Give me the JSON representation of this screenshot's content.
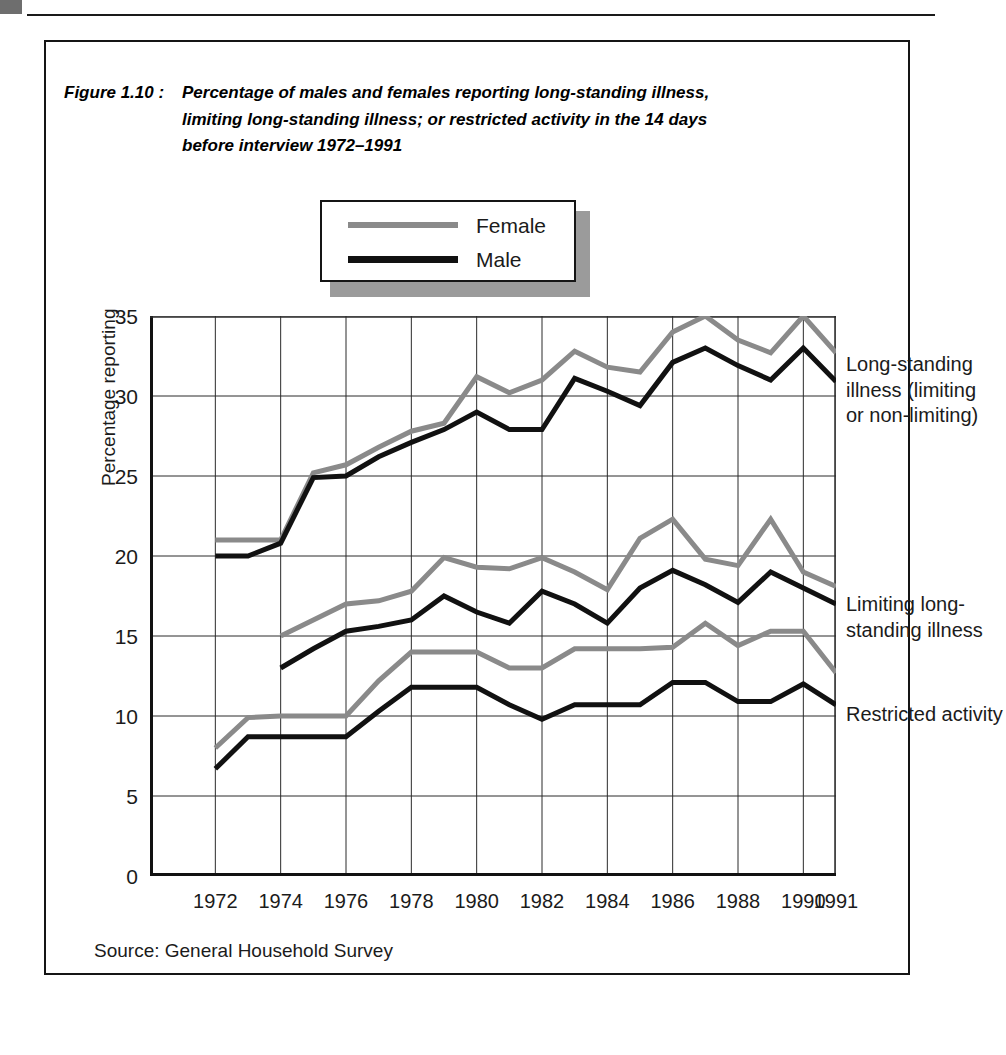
{
  "figure": {
    "number": "Figure 1.10 :",
    "title_line_1": "Percentage of males and females reporting long-standing illness,",
    "title_line_2": "limiting long-standing illness; or restricted activity in the 14 days",
    "title_line_3": "before interview 1972–1991",
    "source": "Source: General Household Survey"
  },
  "legend": {
    "female_label": "Female",
    "male_label": "Male",
    "female_color": "#8a8a8a",
    "male_color": "#111111"
  },
  "annotations": {
    "longstanding_line_1": "Long-standing",
    "longstanding_line_2": "illness (limiting",
    "longstanding_line_3": "or non-limiting)",
    "limiting_line_1": "Limiting long-",
    "limiting_line_2": "standing illness",
    "restricted_line_1": "Restricted activity"
  },
  "chart_data": {
    "type": "line",
    "title": "Percentage of males and females reporting long-standing illness, limiting long-standing illness; or restricted activity in the 14 days before interview 1972–1991",
    "xlabel": "",
    "ylabel": "Percentage reporting",
    "ylim": [
      0,
      35
    ],
    "ytick_labels": [
      "0",
      "5",
      "10",
      "15",
      "20",
      "25",
      "30",
      "35"
    ],
    "yticks": [
      0,
      5,
      10,
      15,
      20,
      25,
      30,
      35
    ],
    "xtick_labels": [
      "1972",
      "1974",
      "1976",
      "1978",
      "1980",
      "1982",
      "1984",
      "1986",
      "1988",
      "1990",
      "1991"
    ],
    "xticks": [
      1972,
      1974,
      1976,
      1978,
      1980,
      1982,
      1984,
      1986,
      1988,
      1990,
      1991
    ],
    "x": [
      1972,
      1973,
      1974,
      1975,
      1976,
      1977,
      1978,
      1979,
      1980,
      1981,
      1982,
      1983,
      1984,
      1985,
      1986,
      1987,
      1988,
      1989,
      1990,
      1991
    ],
    "grid": true,
    "legend_position": "top-center",
    "groups": [
      {
        "name": "Long-standing illness (limiting or non-limiting)",
        "series": [
          {
            "name": "Female",
            "color": "#8a8a8a",
            "x": [
              1972,
              1973,
              1974,
              1975,
              1976,
              1977,
              1978,
              1979,
              1980,
              1981,
              1982,
              1983,
              1984,
              1985,
              1986,
              1987,
              1988,
              1989,
              1990,
              1991
            ],
            "values": [
              21.0,
              21.0,
              21.0,
              25.2,
              25.7,
              26.8,
              27.8,
              28.3,
              31.2,
              30.2,
              31.0,
              32.8,
              31.8,
              31.5,
              34.0,
              35.0,
              33.5,
              32.7,
              35.0,
              32.7
            ]
          },
          {
            "name": "Male",
            "color": "#111111",
            "x": [
              1972,
              1973,
              1974,
              1975,
              1976,
              1977,
              1978,
              1979,
              1980,
              1981,
              1982,
              1983,
              1984,
              1985,
              1986,
              1987,
              1988,
              1989,
              1990,
              1991
            ],
            "values": [
              20.0,
              20.0,
              20.8,
              24.9,
              25.0,
              26.2,
              27.1,
              27.9,
              29.0,
              27.9,
              27.9,
              31.1,
              30.3,
              29.4,
              32.1,
              33.0,
              31.9,
              31.0,
              33.0,
              30.9
            ]
          }
        ]
      },
      {
        "name": "Limiting long-standing illness",
        "series": [
          {
            "name": "Female",
            "color": "#8a8a8a",
            "x": [
              1974,
              1975,
              1976,
              1977,
              1978,
              1979,
              1980,
              1981,
              1982,
              1983,
              1984,
              1985,
              1986,
              1987,
              1988,
              1989,
              1990,
              1991
            ],
            "values": [
              15.0,
              16.0,
              17.0,
              17.2,
              17.8,
              19.9,
              19.3,
              19.2,
              19.9,
              19.0,
              17.9,
              21.1,
              22.3,
              19.8,
              19.4,
              22.3,
              19.0,
              18.1
            ]
          },
          {
            "name": "Male",
            "color": "#111111",
            "x": [
              1974,
              1975,
              1976,
              1977,
              1978,
              1979,
              1980,
              1981,
              1982,
              1983,
              1984,
              1985,
              1986,
              1987,
              1988,
              1989,
              1990,
              1991
            ],
            "values": [
              13.0,
              14.2,
              15.3,
              15.6,
              16.0,
              17.5,
              16.5,
              15.8,
              17.8,
              17.0,
              15.8,
              18.0,
              19.1,
              18.2,
              17.1,
              19.0,
              18.0,
              17.0
            ]
          }
        ]
      },
      {
        "name": "Restricted activity",
        "series": [
          {
            "name": "Female",
            "color": "#8a8a8a",
            "x": [
              1972,
              1973,
              1974,
              1975,
              1976,
              1977,
              1978,
              1979,
              1980,
              1981,
              1982,
              1983,
              1984,
              1985,
              1986,
              1987,
              1988,
              1989,
              1990,
              1991
            ],
            "values": [
              8.0,
              9.9,
              10.0,
              10.0,
              10.0,
              12.2,
              14.0,
              14.0,
              14.0,
              13.0,
              13.0,
              14.2,
              14.2,
              14.2,
              14.3,
              15.8,
              14.4,
              15.3,
              15.3,
              12.7
            ]
          },
          {
            "name": "Male",
            "color": "#111111",
            "x": [
              1972,
              1973,
              1974,
              1975,
              1976,
              1977,
              1978,
              1979,
              1980,
              1981,
              1982,
              1983,
              1984,
              1985,
              1986,
              1987,
              1988,
              1989,
              1990,
              1991
            ],
            "values": [
              6.7,
              8.7,
              8.7,
              8.7,
              8.7,
              10.3,
              11.8,
              11.8,
              11.8,
              10.7,
              9.8,
              10.7,
              10.7,
              10.7,
              12.1,
              12.1,
              10.9,
              10.9,
              12.0,
              10.7
            ]
          }
        ]
      }
    ]
  }
}
